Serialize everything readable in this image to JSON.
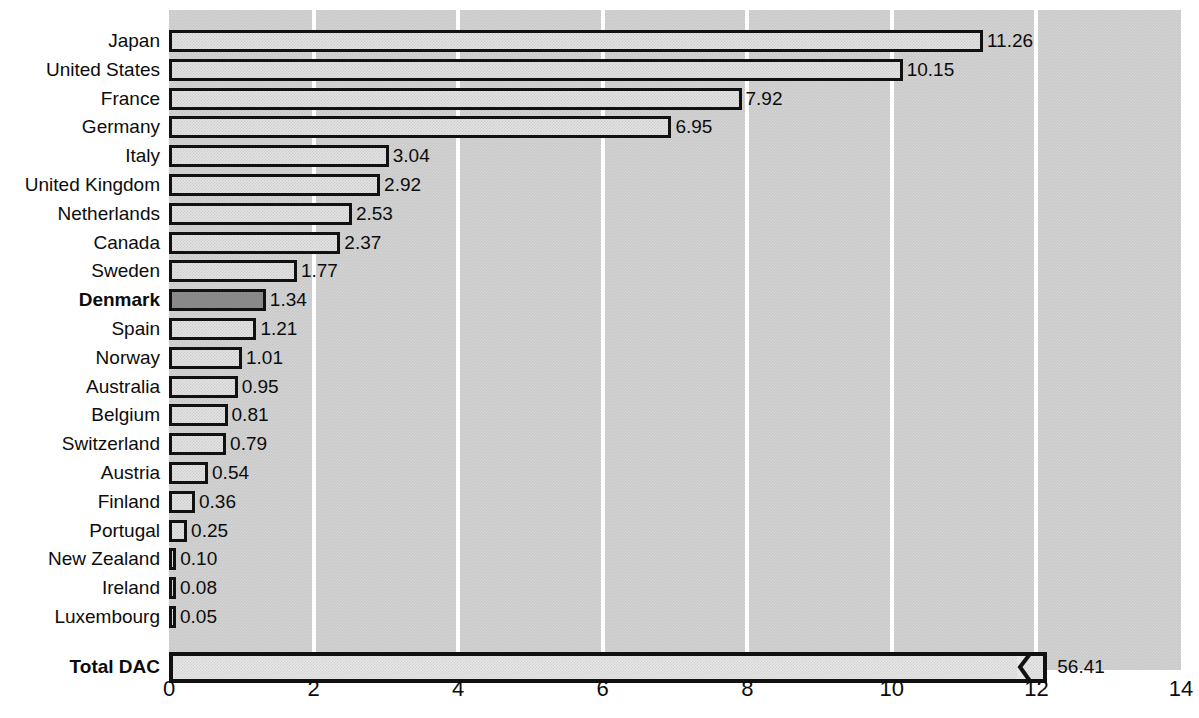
{
  "chart_data": {
    "type": "bar",
    "orientation": "horizontal",
    "title": "",
    "xlabel": "",
    "ylabel": "",
    "xlim": [
      0,
      14
    ],
    "xticks": [
      "0",
      "2",
      "4",
      "6",
      "8",
      "10",
      "12",
      "14"
    ],
    "xtick_values": [
      0,
      2,
      4,
      6,
      8,
      10,
      12,
      14
    ],
    "grid": true,
    "grid_orientation": "vertical",
    "grid_color": "#ffffff",
    "plot_background": "#c9c9c9",
    "bar_fill": "#e3e3e3",
    "bar_border": "#111111",
    "highlight_fill": "#8c8c8c",
    "highlight_category": "Denmark",
    "categories": [
      "Japan",
      "United States",
      "France",
      "Germany",
      "Italy",
      "United Kingdom",
      "Netherlands",
      "Canada",
      "Sweden",
      "Denmark",
      "Spain",
      "Norway",
      "Australia",
      "Belgium",
      "Switzerland",
      "Austria",
      "Finland",
      "Portugal",
      "New Zealand",
      "Ireland",
      "Luxembourg"
    ],
    "values": [
      11.26,
      10.15,
      7.92,
      6.95,
      3.04,
      2.92,
      2.53,
      2.37,
      1.77,
      1.34,
      1.21,
      1.01,
      0.95,
      0.81,
      0.79,
      0.54,
      0.36,
      0.25,
      0.1,
      0.08,
      0.05
    ],
    "value_labels": [
      "11.26",
      "10.15",
      "7.92",
      "6.95",
      "3.04",
      "2.92",
      "2.53",
      "2.37",
      "1.77",
      "1.34",
      "1.21",
      "1.01",
      "0.95",
      "0.81",
      "0.79",
      "0.54",
      "0.36",
      "0.25",
      "0.10",
      "0.08",
      "0.05"
    ],
    "bars": [
      {
        "label": "Japan",
        "value": 11.26,
        "value_label": "11.26",
        "bold": false,
        "highlight": false
      },
      {
        "label": "United States",
        "value": 10.15,
        "value_label": "10.15",
        "bold": false,
        "highlight": false
      },
      {
        "label": "France",
        "value": 7.92,
        "value_label": "7.92",
        "bold": false,
        "highlight": false
      },
      {
        "label": "Germany",
        "value": 6.95,
        "value_label": "6.95",
        "bold": false,
        "highlight": false
      },
      {
        "label": "Italy",
        "value": 3.04,
        "value_label": "3.04",
        "bold": false,
        "highlight": false
      },
      {
        "label": "United Kingdom",
        "value": 2.92,
        "value_label": "2.92",
        "bold": false,
        "highlight": false
      },
      {
        "label": "Netherlands",
        "value": 2.53,
        "value_label": "2.53",
        "bold": false,
        "highlight": false
      },
      {
        "label": "Canada",
        "value": 2.37,
        "value_label": "2.37",
        "bold": false,
        "highlight": false
      },
      {
        "label": "Sweden",
        "value": 1.77,
        "value_label": "1.77",
        "bold": false,
        "highlight": false
      },
      {
        "label": "Denmark",
        "value": 1.34,
        "value_label": "1.34",
        "bold": true,
        "highlight": true
      },
      {
        "label": "Spain",
        "value": 1.21,
        "value_label": "1.21",
        "bold": false,
        "highlight": false
      },
      {
        "label": "Norway",
        "value": 1.01,
        "value_label": "1.01",
        "bold": false,
        "highlight": false
      },
      {
        "label": "Australia",
        "value": 0.95,
        "value_label": "0.95",
        "bold": false,
        "highlight": false
      },
      {
        "label": "Belgium",
        "value": 0.81,
        "value_label": "0.81",
        "bold": false,
        "highlight": false
      },
      {
        "label": "Switzerland",
        "value": 0.79,
        "value_label": "0.79",
        "bold": false,
        "highlight": false
      },
      {
        "label": "Austria",
        "value": 0.54,
        "value_label": "0.54",
        "bold": false,
        "highlight": false
      },
      {
        "label": "Finland",
        "value": 0.36,
        "value_label": "0.36",
        "bold": false,
        "highlight": false
      },
      {
        "label": "Portugal",
        "value": 0.25,
        "value_label": "0.25",
        "bold": false,
        "highlight": false
      },
      {
        "label": "New Zealand",
        "value": 0.1,
        "value_label": "0.10",
        "bold": false,
        "highlight": false
      },
      {
        "label": "Ireland",
        "value": 0.08,
        "value_label": "0.08",
        "bold": false,
        "highlight": false
      },
      {
        "label": "Luxembourg",
        "value": 0.05,
        "value_label": "0.05",
        "bold": false,
        "highlight": false
      }
    ],
    "total": {
      "label": "Total DAC",
      "value": 56.41,
      "value_label": "56.41",
      "bold": true,
      "axis_broken": true,
      "drawn_to": 12.15,
      "note": "bar is truncated with a break symbol; actual value exceeds the 14 axis maximum"
    }
  }
}
